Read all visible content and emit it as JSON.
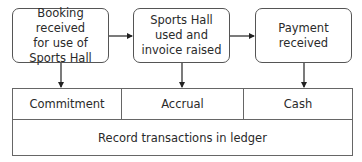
{
  "diagram": {
    "type": "flowchart",
    "stages": [
      {
        "id": "booking",
        "label": "Booking received\nfor use of\nSports Hall"
      },
      {
        "id": "usage",
        "label": "Sports Hall\nused and\ninvoice raised"
      },
      {
        "id": "payment",
        "label": "Payment\nreceived"
      }
    ],
    "flows": [
      {
        "from": "booking",
        "to": "usage"
      },
      {
        "from": "usage",
        "to": "payment"
      },
      {
        "from": "booking",
        "to": "commitment"
      },
      {
        "from": "usage",
        "to": "accrual"
      },
      {
        "from": "payment",
        "to": "cash"
      }
    ],
    "ledger": {
      "columns": [
        {
          "id": "commitment",
          "label": "Commitment"
        },
        {
          "id": "accrual",
          "label": "Accrual"
        },
        {
          "id": "cash",
          "label": "Cash"
        }
      ],
      "footer": "Record transactions in ledger"
    },
    "colors": {
      "stroke": "#555555",
      "text": "#2a2a2a",
      "background": "#ffffff"
    }
  }
}
